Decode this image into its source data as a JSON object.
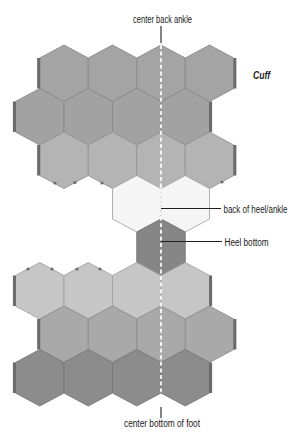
{
  "labels": {
    "top": "center back ankle",
    "cuff": "Cuff",
    "heel_back": "back of heel/ankle",
    "heel_bottom": "Heel bottom",
    "bottom": "center bottom of foot"
  },
  "diagram": {
    "type": "hexagon sock layout",
    "centerline": "center back / center bottom",
    "rows": [
      {
        "section": "cuff",
        "offset": "odd",
        "cols": [
          0,
          1,
          2,
          3
        ],
        "fill": "#a4a4a4",
        "stroke": "#8a8a8a",
        "side_bars": true
      },
      {
        "section": "cuff",
        "offset": "even",
        "cols": [
          0,
          1,
          2,
          3
        ],
        "fill": "#a2a2a2",
        "stroke": "#888888",
        "side_bars": true
      },
      {
        "section": "cuff",
        "offset": "odd",
        "cols": [
          0,
          1,
          2,
          3
        ],
        "fill": "#b4b4b4",
        "stroke": "#939393",
        "side_bars": true
      },
      {
        "section": "heel-back",
        "offset": "even",
        "cols": [
          2,
          3
        ],
        "fill": "#f5f5f5",
        "stroke": "#a8a8a8",
        "side_bars": false
      },
      {
        "section": "heel-bottom",
        "offset": "odd",
        "cols": [
          2
        ],
        "fill": "#868686",
        "stroke": "#767676",
        "side_bars": false
      },
      {
        "section": "foot",
        "offset": "even",
        "cols": [
          0,
          1,
          2,
          3
        ],
        "fill": "#c6c6c6",
        "stroke": "#a2a2a2",
        "side_bars": true
      },
      {
        "section": "foot",
        "offset": "odd",
        "cols": [
          0,
          1,
          2,
          3
        ],
        "fill": "#a9a9a9",
        "stroke": "#8e8e8e",
        "side_bars": true
      },
      {
        "section": "foot",
        "offset": "even",
        "cols": [
          0,
          1,
          2,
          3
        ],
        "fill": "#8c8c8c",
        "stroke": "#777777",
        "side_bars": true
      }
    ],
    "colors": {
      "side_bar": "#6a6a6a",
      "centerline": "#ffffff",
      "centerline_on_light": "#b5b5b5",
      "leader": "#1f1f1f"
    }
  }
}
